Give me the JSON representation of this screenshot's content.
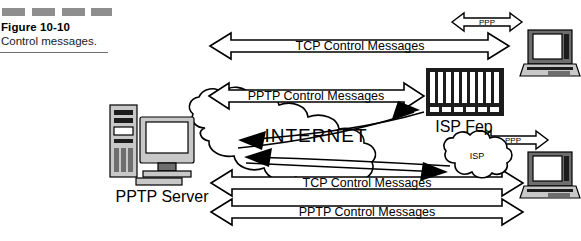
{
  "caption": {
    "figure_number": "Figure 10-10",
    "title": "Control messages.",
    "dash_count": 4,
    "dash_color": "#8e8e8e"
  },
  "diagram": {
    "type": "network-protocol-flow",
    "background": "#ffffff",
    "ink_color": "#000000",
    "cloud_label": "INTERNET",
    "nodes": [
      {
        "id": "pptp-server",
        "label": "PPTP Server",
        "kind": "desktop-computer"
      },
      {
        "id": "isp-fep",
        "label": "ISP Fep",
        "kind": "rack-chassis"
      },
      {
        "id": "isp-cloud",
        "label": "ISP",
        "kind": "cloud"
      },
      {
        "id": "laptop-top",
        "label": "",
        "kind": "laptop"
      },
      {
        "id": "laptop-bottom",
        "label": "",
        "kind": "laptop"
      }
    ],
    "block_arrows": [
      {
        "id": "tcp-top",
        "label": "TCP Control Messages",
        "direction": "bidirectional"
      },
      {
        "id": "pptp-mid",
        "label": "PPTP Control Messages",
        "direction": "bidirectional"
      },
      {
        "id": "tcp-bot",
        "label": "TCP Control Messages",
        "direction": "bidirectional"
      },
      {
        "id": "pptp-bot",
        "label": "PPTP Control Messages",
        "direction": "bidirectional"
      },
      {
        "id": "ppp-top",
        "label": "PPP",
        "direction": "bidirectional"
      },
      {
        "id": "ppp-bot",
        "label": "PPP",
        "direction": "bidirectional"
      }
    ]
  }
}
